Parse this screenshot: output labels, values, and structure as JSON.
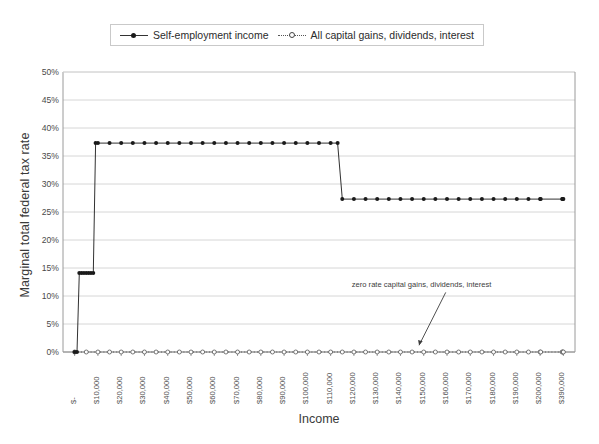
{
  "chart_data": {
    "type": "line",
    "title": "",
    "xlabel": "Income",
    "ylabel": "Marginal total federal tax rate",
    "xlim": [
      0,
      400000
    ],
    "ylim": [
      0,
      0.5
    ],
    "grid": true,
    "legend_position": "top-center",
    "y_tick_labels": [
      "0%",
      "5%",
      "10%",
      "15%",
      "20%",
      "25%",
      "30%",
      "35%",
      "40%",
      "45%",
      "50%"
    ],
    "y_tick_values": [
      0,
      5,
      10,
      15,
      20,
      25,
      30,
      35,
      40,
      45,
      50
    ],
    "x_tick_labels": [
      "$-",
      "$10,000",
      "$20,000",
      "$30,000",
      "$40,000",
      "$50,000",
      "$60,000",
      "$70,000",
      "$80,000",
      "$90,000",
      "$100,000",
      "$110,000",
      "$120,000",
      "$130,000",
      "$140,000",
      "$150,000",
      "$160,000",
      "$170,000",
      "$180,000",
      "$190,000",
      "$200,000",
      "$390,000"
    ],
    "x_tick_values": [
      0,
      10000,
      20000,
      30000,
      40000,
      50000,
      60000,
      70000,
      80000,
      90000,
      100000,
      110000,
      120000,
      130000,
      140000,
      150000,
      160000,
      170000,
      180000,
      190000,
      200000,
      390000
    ],
    "series": [
      {
        "name": "Self-employment income",
        "marker": "filled-circle",
        "line": "solid",
        "color": "#1a1a1a",
        "points": [
          {
            "x": 0,
            "y": 0
          },
          {
            "x": 1000,
            "y": 0
          },
          {
            "x": 2000,
            "y": 14.1
          },
          {
            "x": 3000,
            "y": 14.1
          },
          {
            "x": 4000,
            "y": 14.1
          },
          {
            "x": 5000,
            "y": 14.1
          },
          {
            "x": 6000,
            "y": 14.1
          },
          {
            "x": 7000,
            "y": 14.1
          },
          {
            "x": 8000,
            "y": 14.1
          },
          {
            "x": 9000,
            "y": 37.3
          },
          {
            "x": 10000,
            "y": 37.3
          },
          {
            "x": 15000,
            "y": 37.3
          },
          {
            "x": 20000,
            "y": 37.3
          },
          {
            "x": 25000,
            "y": 37.3
          },
          {
            "x": 30000,
            "y": 37.3
          },
          {
            "x": 35000,
            "y": 37.3
          },
          {
            "x": 40000,
            "y": 37.3
          },
          {
            "x": 45000,
            "y": 37.3
          },
          {
            "x": 50000,
            "y": 37.3
          },
          {
            "x": 55000,
            "y": 37.3
          },
          {
            "x": 60000,
            "y": 37.3
          },
          {
            "x": 65000,
            "y": 37.3
          },
          {
            "x": 70000,
            "y": 37.3
          },
          {
            "x": 75000,
            "y": 37.3
          },
          {
            "x": 80000,
            "y": 37.3
          },
          {
            "x": 85000,
            "y": 37.3
          },
          {
            "x": 90000,
            "y": 37.3
          },
          {
            "x": 95000,
            "y": 37.3
          },
          {
            "x": 100000,
            "y": 37.3
          },
          {
            "x": 105000,
            "y": 37.3
          },
          {
            "x": 110000,
            "y": 37.3
          },
          {
            "x": 113000,
            "y": 37.3
          },
          {
            "x": 115000,
            "y": 27.3
          },
          {
            "x": 120000,
            "y": 27.3
          },
          {
            "x": 125000,
            "y": 27.3
          },
          {
            "x": 130000,
            "y": 27.3
          },
          {
            "x": 135000,
            "y": 27.3
          },
          {
            "x": 140000,
            "y": 27.3
          },
          {
            "x": 145000,
            "y": 27.3
          },
          {
            "x": 150000,
            "y": 27.3
          },
          {
            "x": 155000,
            "y": 27.3
          },
          {
            "x": 160000,
            "y": 27.3
          },
          {
            "x": 165000,
            "y": 27.3
          },
          {
            "x": 170000,
            "y": 27.3
          },
          {
            "x": 175000,
            "y": 27.3
          },
          {
            "x": 180000,
            "y": 27.3
          },
          {
            "x": 185000,
            "y": 27.3
          },
          {
            "x": 190000,
            "y": 27.3
          },
          {
            "x": 195000,
            "y": 27.3
          },
          {
            "x": 200000,
            "y": 27.3
          },
          {
            "x": 205000,
            "y": 27.3
          },
          {
            "x": 380000,
            "y": 27.3
          },
          {
            "x": 385000,
            "y": 27.3
          },
          {
            "x": 390000,
            "y": 27.3
          }
        ]
      },
      {
        "name": "All capital gains, dividends, interest",
        "marker": "open-circle",
        "line": "dotted",
        "color": "#555555",
        "points": [
          {
            "x": 0,
            "y": 0
          },
          {
            "x": 5000,
            "y": 0
          },
          {
            "x": 10000,
            "y": 0
          },
          {
            "x": 15000,
            "y": 0
          },
          {
            "x": 20000,
            "y": 0
          },
          {
            "x": 25000,
            "y": 0
          },
          {
            "x": 30000,
            "y": 0
          },
          {
            "x": 35000,
            "y": 0
          },
          {
            "x": 40000,
            "y": 0
          },
          {
            "x": 45000,
            "y": 0
          },
          {
            "x": 50000,
            "y": 0
          },
          {
            "x": 55000,
            "y": 0
          },
          {
            "x": 60000,
            "y": 0
          },
          {
            "x": 65000,
            "y": 0
          },
          {
            "x": 70000,
            "y": 0
          },
          {
            "x": 75000,
            "y": 0
          },
          {
            "x": 80000,
            "y": 0
          },
          {
            "x": 85000,
            "y": 0
          },
          {
            "x": 90000,
            "y": 0
          },
          {
            "x": 95000,
            "y": 0
          },
          {
            "x": 100000,
            "y": 0
          },
          {
            "x": 105000,
            "y": 0
          },
          {
            "x": 110000,
            "y": 0
          },
          {
            "x": 115000,
            "y": 0
          },
          {
            "x": 120000,
            "y": 0
          },
          {
            "x": 125000,
            "y": 0
          },
          {
            "x": 130000,
            "y": 0
          },
          {
            "x": 135000,
            "y": 0
          },
          {
            "x": 140000,
            "y": 0
          },
          {
            "x": 145000,
            "y": 0
          },
          {
            "x": 150000,
            "y": 0
          },
          {
            "x": 155000,
            "y": 0
          },
          {
            "x": 160000,
            "y": 0
          },
          {
            "x": 165000,
            "y": 0
          },
          {
            "x": 170000,
            "y": 0
          },
          {
            "x": 175000,
            "y": 0
          },
          {
            "x": 180000,
            "y": 0
          },
          {
            "x": 185000,
            "y": 0
          },
          {
            "x": 190000,
            "y": 0
          },
          {
            "x": 195000,
            "y": 0
          },
          {
            "x": 200000,
            "y": 0
          },
          {
            "x": 205000,
            "y": 0
          },
          {
            "x": 380000,
            "y": 0
          },
          {
            "x": 385000,
            "y": 0
          },
          {
            "x": 390000,
            "y": 0
          }
        ]
      }
    ],
    "annotations": [
      {
        "text": "zero rate capital gains, dividends, interest",
        "x": 150000,
        "y": 8.5,
        "arrow_to_x": 148000,
        "arrow_to_y": 1.2
      }
    ]
  },
  "legend": {
    "items": [
      {
        "label": "Self-employment income",
        "style": "solid-filled"
      },
      {
        "label": "All capital gains, dividends, interest",
        "style": "dotted-open"
      }
    ]
  },
  "axes": {
    "y_title": "Marginal total federal tax rate",
    "x_title": "Income"
  },
  "colors": {
    "series1": "#1a1a1a",
    "series2": "#555555",
    "grid": "#d6d6d6",
    "axis": "#9a9a9a",
    "text": "#3a3a3a"
  }
}
